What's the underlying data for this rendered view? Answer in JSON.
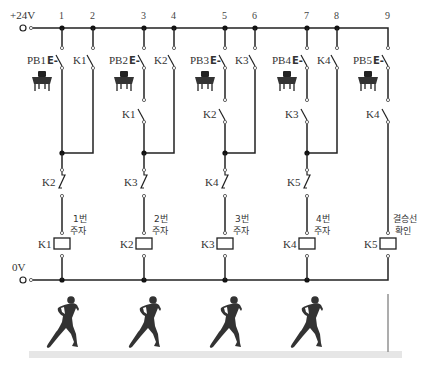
{
  "supply": {
    "positive_label": "+24V",
    "negative_label": "0V"
  },
  "nodes": [
    "1",
    "2",
    "3",
    "4",
    "5",
    "6",
    "7",
    "8",
    "9"
  ],
  "rungs": [
    {
      "pushbutton": "PB1",
      "pb_symbol": "E-",
      "interlock_contact": null,
      "seal_contact": "K1",
      "nc_contact": "K2",
      "coil": "K1",
      "coil_note_line1": "1번",
      "coil_note_line2": "주자"
    },
    {
      "pushbutton": "PB2",
      "pb_symbol": "E-",
      "interlock_contact": "K1",
      "seal_contact": "K2",
      "nc_contact": "K3",
      "coil": "K2",
      "coil_note_line1": "2번",
      "coil_note_line2": "주자"
    },
    {
      "pushbutton": "PB3",
      "pb_symbol": "E-",
      "interlock_contact": "K2",
      "seal_contact": "K3",
      "nc_contact": "K4",
      "coil": "K3",
      "coil_note_line1": "3번",
      "coil_note_line2": "주자"
    },
    {
      "pushbutton": "PB4",
      "pb_symbol": "E-",
      "interlock_contact": "K3",
      "seal_contact": "K4",
      "nc_contact": "K5",
      "coil": "K4",
      "coil_note_line1": "4번",
      "coil_note_line2": "주자"
    },
    {
      "pushbutton": "PB5",
      "pb_symbol": "E-",
      "interlock_contact": "K4",
      "seal_contact": null,
      "nc_contact": null,
      "coil": "K5",
      "coil_note_line1": "결승선",
      "coil_note_line2": "확인"
    }
  ],
  "illustration": {
    "runners": 4,
    "runner_color": "#333333",
    "track_color": "#e6e6e6",
    "finish_line_color": "#999999"
  }
}
